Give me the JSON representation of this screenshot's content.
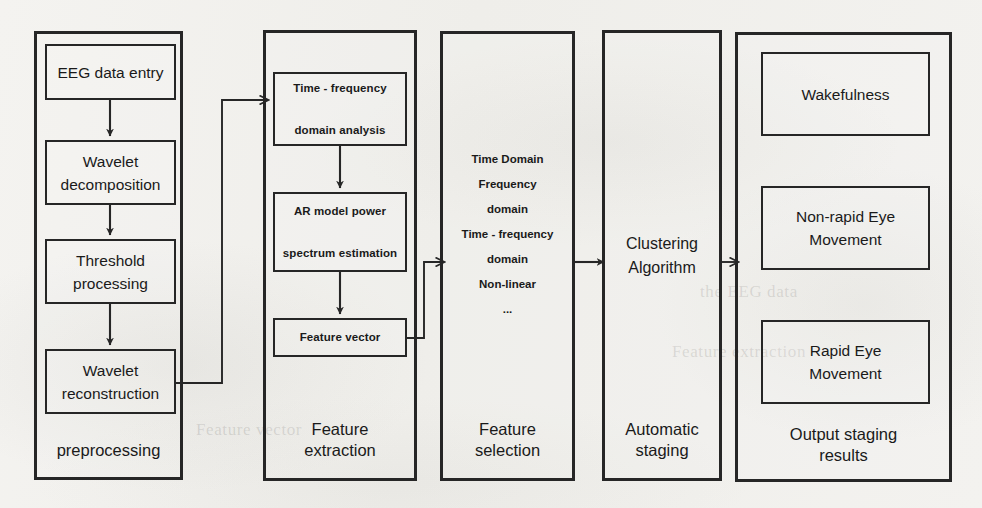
{
  "diagram": {
    "stages": [
      {
        "id": "preprocessing",
        "label": "preprocessing",
        "nodes": [
          {
            "id": "eeg-data-entry",
            "text": "EEG data entry"
          },
          {
            "id": "wavelet-decomposition",
            "line1": "Wavelet",
            "line2": "decomposition"
          },
          {
            "id": "threshold-processing",
            "line1": "Threshold",
            "line2": "processing"
          },
          {
            "id": "wavelet-reconstruction",
            "line1": "Wavelet",
            "line2": "reconstruction"
          }
        ]
      },
      {
        "id": "feature-extraction",
        "label_line1": "Feature",
        "label_line2": "extraction",
        "nodes": [
          {
            "id": "time-frequency-domain-analysis",
            "line1": "Time - frequency",
            "line2": "domain analysis"
          },
          {
            "id": "ar-model-power-spectrum",
            "line1": "AR model power",
            "line2": "spectrum estimation"
          },
          {
            "id": "feature-vector",
            "text": "Feature vector"
          }
        ]
      },
      {
        "id": "feature-selection",
        "label_line1": "Feature",
        "label_line2": "selection",
        "items": [
          "Time Domain",
          "Frequency",
          "domain",
          "Time - frequency",
          "domain",
          "Non-linear",
          "..."
        ]
      },
      {
        "id": "automatic-staging",
        "label_line1": "Automatic",
        "label_line2": "staging",
        "center_line1": "Clustering",
        "center_line2": "Algorithm"
      },
      {
        "id": "output-staging-results",
        "label_line1": "Output staging",
        "label_line2": "results",
        "nodes": [
          {
            "id": "wakefulness",
            "text": "Wakefulness"
          },
          {
            "id": "non-rapid-eye-movement",
            "line1": "Non-rapid Eye",
            "line2": "Movement"
          },
          {
            "id": "rapid-eye-movement",
            "line1": "Rapid Eye",
            "line2": "Movement"
          }
        ]
      }
    ],
    "colors": {
      "stroke": "#262626",
      "text": "#1a1a1a",
      "background": "#f2f1ee"
    }
  },
  "background_bleed": [
    {
      "text": "the EEG data",
      "x": 700,
      "y": 290
    },
    {
      "text": "Feature extraction",
      "x": 680,
      "y": 350
    },
    {
      "text": "Feature vector",
      "x": 150,
      "y": 430
    }
  ]
}
